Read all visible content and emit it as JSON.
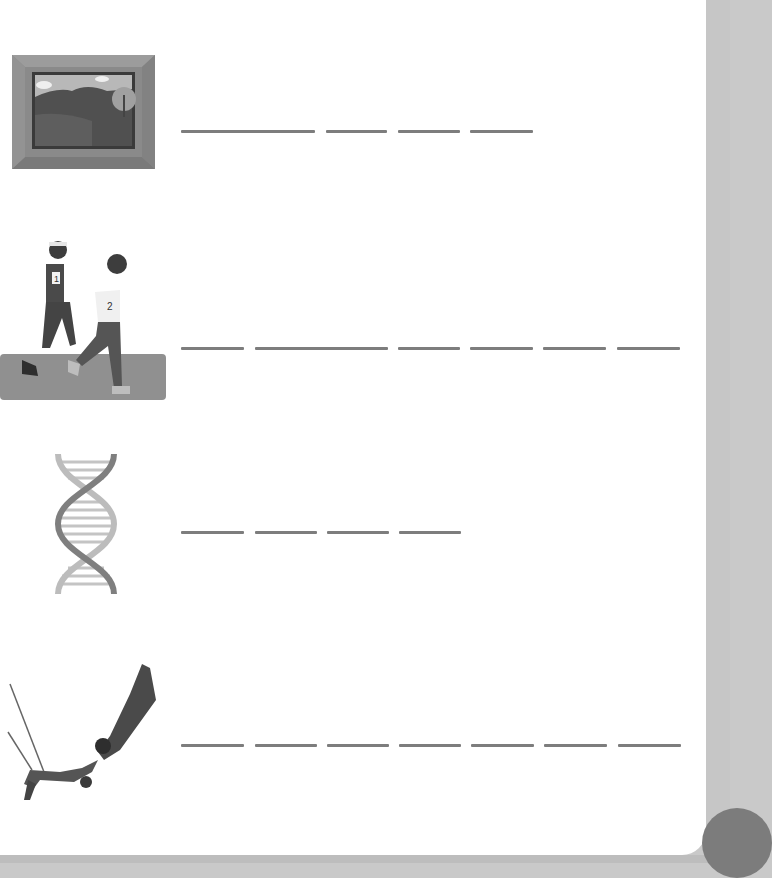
{
  "worksheet": {
    "rows": [
      {
        "clue": "painting-in-frame",
        "blanks": [
          {
            "x": 181,
            "w": 134
          },
          {
            "x": 326,
            "w": 61
          },
          {
            "x": 398,
            "w": 62
          },
          {
            "x": 470,
            "w": 63
          }
        ],
        "line_y": 131
      },
      {
        "clue": "runners",
        "runner_numbers": [
          "1",
          "2"
        ],
        "blanks": [
          {
            "x": 181,
            "w": 63
          },
          {
            "x": 255,
            "w": 133
          },
          {
            "x": 398,
            "w": 62
          },
          {
            "x": 470,
            "w": 63
          },
          {
            "x": 543,
            "w": 63
          },
          {
            "x": 617,
            "w": 63
          }
        ],
        "line_y": 348
      },
      {
        "clue": "dna-double-helix",
        "blanks": [
          {
            "x": 181,
            "w": 63
          },
          {
            "x": 255,
            "w": 62
          },
          {
            "x": 327,
            "w": 62
          },
          {
            "x": 399,
            "w": 62
          }
        ],
        "line_y": 532
      },
      {
        "clue": "trapeze-artists",
        "blanks": [
          {
            "x": 181,
            "w": 63
          },
          {
            "x": 255,
            "w": 62
          },
          {
            "x": 327,
            "w": 62
          },
          {
            "x": 399,
            "w": 62
          },
          {
            "x": 471,
            "w": 63
          },
          {
            "x": 544,
            "w": 63
          },
          {
            "x": 618,
            "w": 63
          }
        ],
        "line_y": 745
      }
    ]
  },
  "colors": {
    "page": "#ffffff",
    "side_tab": "#c6c6c6",
    "blank_line": "#7d7d7d"
  }
}
